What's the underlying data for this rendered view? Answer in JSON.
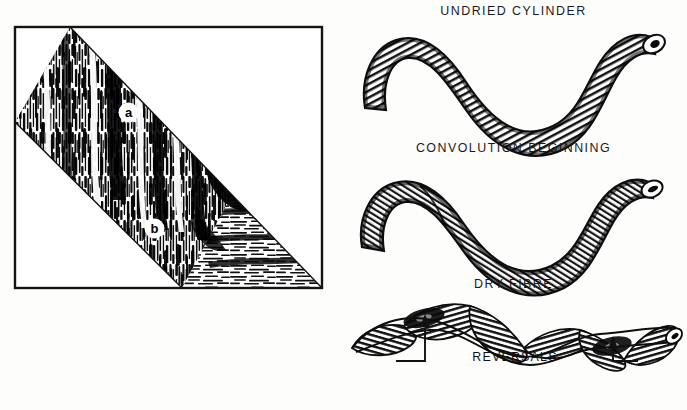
{
  "figure": {
    "ink_color": "#111111",
    "background_color": "#ffffff"
  },
  "left_panel": {
    "name": "photomicrograph-panel",
    "frame": {
      "x": 15,
      "y": 27,
      "width": 307,
      "height": 261
    },
    "band": {
      "description": "diagonal fibre band",
      "upper_edge": [
        [
          70,
          27
        ],
        [
          322,
          288
        ]
      ],
      "lower_edge": [
        [
          15,
          122
        ],
        [
          182,
          288
        ]
      ]
    },
    "labels": [
      {
        "id": "a",
        "text": "a",
        "x": 120,
        "y": 104,
        "region": "vertical-striated-zone"
      },
      {
        "id": "b",
        "text": "b",
        "x": 146,
        "y": 220,
        "region": "horizontal-laminated-zone"
      }
    ]
  },
  "right_panel": {
    "diagrams": [
      {
        "id": "undried-cylinder",
        "caption": "UNDRIED CYLINDER",
        "shape": "smooth S-curve hollow cylinder",
        "has_lumen_opening": true,
        "lumen_end": "right"
      },
      {
        "id": "convolution-beginning",
        "caption": "CONVOLUTION BEGINNING",
        "shape": "S-curve cylinder beginning to flatten",
        "has_lumen_opening": true,
        "lumen_end": "right"
      },
      {
        "id": "dry-fibre",
        "caption": "DRY FIBRE",
        "shape": "flattened twisted ribbon with convolutions",
        "has_lumen_opening": true,
        "lumen_end": "right",
        "annotation": {
          "label": "REVERSALS",
          "arrow_count": 2,
          "arrow_targets": [
            {
              "x": 425,
              "y": 318
            },
            {
              "x": 614,
              "y": 338
            }
          ]
        }
      }
    ]
  }
}
